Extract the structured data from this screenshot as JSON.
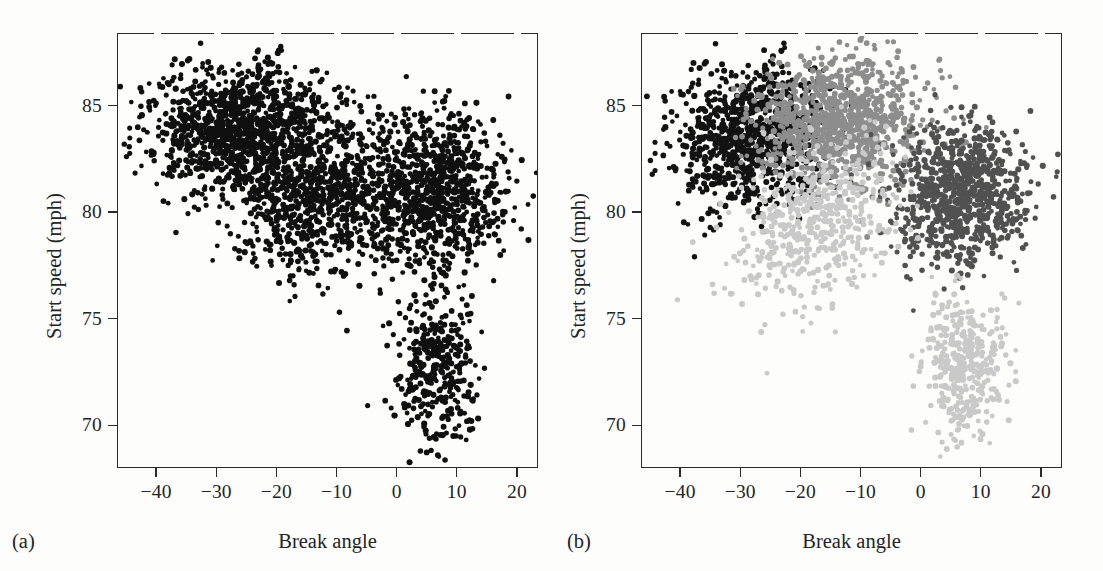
{
  "figure": {
    "background": "#fdfdfc",
    "panels": [
      {
        "tag": "(a)",
        "xlabel": "Break angle",
        "ylabel": "Start speed (mph)"
      },
      {
        "tag": "(b)",
        "xlabel": "Break angle",
        "ylabel": "Start speed (mph)"
      }
    ]
  },
  "axes": {
    "x_ticks": [
      "−40",
      "−30",
      "−20",
      "−10",
      "0",
      "10",
      "20"
    ],
    "x_tick_values": [
      -40,
      -30,
      -20,
      -10,
      0,
      10,
      20
    ],
    "y_ticks": [
      "85",
      "80",
      "75",
      "70"
    ],
    "y_tick_values": [
      85,
      80,
      75,
      70
    ],
    "xlim": [
      -46.5,
      23.5
    ],
    "ylim": [
      68.0,
      88.4
    ],
    "grid": false
  },
  "chart_data": {
    "type": "scatter",
    "title": "",
    "xlabel": "Break angle",
    "ylabel": "Start speed (mph)",
    "xlim": [
      -46.5,
      23.5
    ],
    "ylim": [
      68.0,
      88.4
    ],
    "grid": false,
    "legend_position": "none",
    "marker_size_px": 5.4,
    "panels": [
      {
        "tag": "(a)",
        "description": "All pitches plotted in a single color (black); no cluster distinction.",
        "series": [
          {
            "name": "all-pitches",
            "color": "#101010",
            "n_points": 3200,
            "clusters": [
              {
                "name": "fastball-left",
                "n": 1150,
                "cx": -26.0,
                "cy": 84.0,
                "sx": 7.5,
                "sy": 1.55,
                "rho": 0.12
              },
              {
                "name": "changeup-mid",
                "n": 820,
                "cx": -13.0,
                "cy": 80.8,
                "sx": 7.2,
                "sy": 1.75,
                "rho": 0.2
              },
              {
                "name": "slider-right",
                "n": 880,
                "cx": 6.0,
                "cy": 80.9,
                "sx": 6.0,
                "sy": 1.85,
                "rho": 0.05
              },
              {
                "name": "curveball-tail",
                "n": 350,
                "cx": 7.0,
                "cy": 72.6,
                "sx": 3.1,
                "sy": 1.65,
                "rho": 0.0
              }
            ]
          }
        ]
      },
      {
        "tag": "(b)",
        "description": "Same pitches colored by cluster assignment into four groups (four gray levels).",
        "series": [
          {
            "name": "cluster-1-black",
            "color": "#131313",
            "n_points": 900,
            "clusters": [
              {
                "name": "fastball-left",
                "n": 900,
                "cx": -28.5,
                "cy": 83.6,
                "sx": 6.4,
                "sy": 1.75,
                "rho": 0.18
              }
            ]
          },
          {
            "name": "cluster-2-medium-gray",
            "color": "#8d8d8d",
            "n_points": 1000,
            "clusters": [
              {
                "name": "upper-mid",
                "n": 1000,
                "cx": -13.5,
                "cy": 84.3,
                "sx": 7.0,
                "sy": 1.45,
                "rho": 0.1
              }
            ]
          },
          {
            "name": "cluster-3-dark-gray",
            "color": "#515151",
            "n_points": 850,
            "clusters": [
              {
                "name": "slider-right",
                "n": 850,
                "cx": 6.5,
                "cy": 80.8,
                "sx": 5.6,
                "sy": 1.6,
                "rho": 0.06
              }
            ]
          },
          {
            "name": "cluster-4-light-gray",
            "color": "#c9c9c9",
            "n_points": 900,
            "clusters": [
              {
                "name": "lower-left-lobe",
                "n": 520,
                "cx": -17.0,
                "cy": 79.6,
                "sx": 6.2,
                "sy": 1.75,
                "rho": 0.3
              },
              {
                "name": "curveball-tail",
                "n": 380,
                "cx": 7.0,
                "cy": 72.6,
                "sx": 3.2,
                "sy": 1.7,
                "rho": 0.0
              }
            ]
          }
        ]
      }
    ]
  }
}
